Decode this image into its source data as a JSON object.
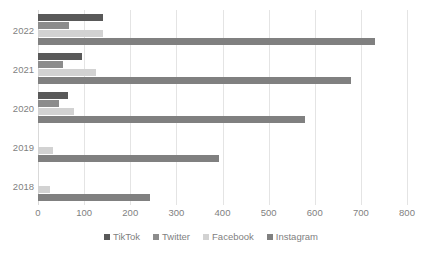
{
  "chart_data": {
    "type": "bar",
    "orientation": "horizontal",
    "title": "",
    "subtitle": "",
    "xlabel": "",
    "ylabel": "",
    "xlim": [
      0,
      800
    ],
    "xticks": [
      0,
      100,
      200,
      300,
      400,
      500,
      600,
      700,
      800
    ],
    "xtick_labels": [
      "0",
      "100",
      "200",
      "300",
      "400",
      "500",
      "600",
      "700",
      "800"
    ],
    "categories": [
      "2022",
      "2021",
      "2020",
      "2019",
      "2018"
    ],
    "grid": "vertical",
    "legend_position": "bottom",
    "series": [
      {
        "name": "TikTok",
        "color": "#595959",
        "values": [
          140,
          95,
          65,
          0,
          0
        ]
      },
      {
        "name": "Twitter",
        "color": "#8c8c8c",
        "values": [
          68,
          55,
          45,
          0,
          0
        ]
      },
      {
        "name": "Facebook",
        "color": "#d2d2d2",
        "values": [
          141,
          125,
          78,
          33,
          27
        ]
      },
      {
        "name": "Instagram",
        "color": "#808080",
        "values": [
          730,
          678,
          578,
          393,
          243
        ]
      }
    ]
  },
  "legend": {
    "items": [
      {
        "label": "TikTok",
        "color": "#595959"
      },
      {
        "label": "Twitter",
        "color": "#8c8c8c"
      },
      {
        "label": "Facebook",
        "color": "#d2d2d2"
      },
      {
        "label": "Instagram",
        "color": "#808080"
      }
    ]
  },
  "colors": {
    "gridline": "#e4e4e4",
    "axis": "#d9d9d9",
    "tick_text": "#7f7f7f",
    "background": "#ffffff"
  }
}
